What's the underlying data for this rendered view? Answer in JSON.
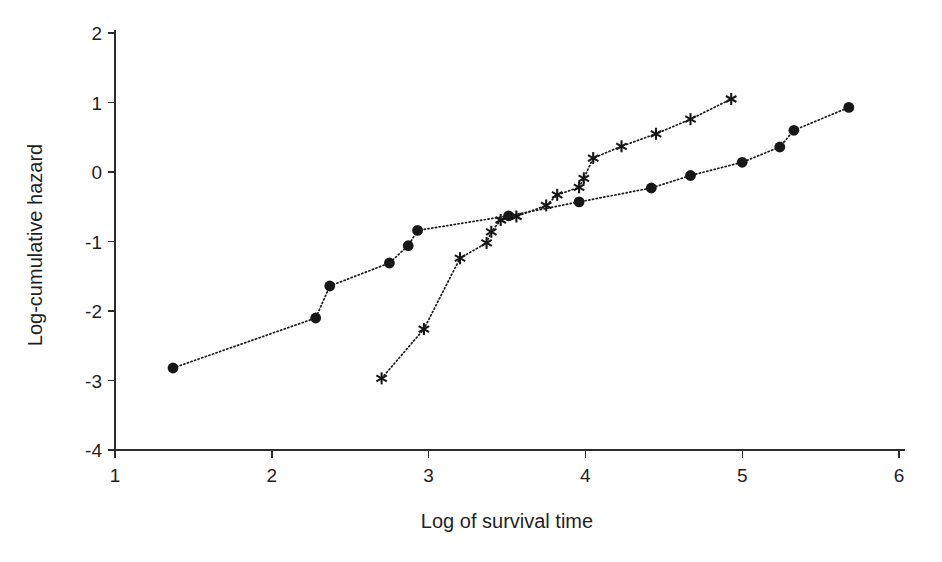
{
  "chart_data": {
    "type": "scatter",
    "title": "",
    "xlabel": "Log of survival time",
    "ylabel": "Log-cumulative hazard",
    "xlim": [
      1,
      6
    ],
    "ylim": [
      -4,
      2
    ],
    "xticks": [
      1,
      2,
      3,
      4,
      5,
      6
    ],
    "yticks": [
      2,
      1,
      0,
      -1,
      -2,
      -3,
      -4
    ],
    "xtick_labels": [
      "1",
      "2",
      "3",
      "4",
      "5",
      "6"
    ],
    "ytick_labels": [
      "2",
      "1",
      "0",
      "-1",
      "-2",
      "-3",
      "-4"
    ],
    "grid": false,
    "legend": "none",
    "series": [
      {
        "name": "group-1",
        "marker": "circle",
        "linestyle": "dotted",
        "points": [
          [
            1.37,
            -2.82
          ],
          [
            2.28,
            -2.1
          ],
          [
            2.37,
            -1.64
          ],
          [
            2.75,
            -1.31
          ],
          [
            2.87,
            -1.06
          ],
          [
            2.93,
            -0.84
          ],
          [
            3.51,
            -0.63
          ],
          [
            3.96,
            -0.43
          ],
          [
            4.42,
            -0.23
          ],
          [
            4.67,
            -0.05
          ],
          [
            5.0,
            0.14
          ],
          [
            5.24,
            0.36
          ],
          [
            5.33,
            0.6
          ],
          [
            5.68,
            0.93
          ]
        ]
      },
      {
        "name": "group-2",
        "marker": "asterisk",
        "linestyle": "dotted",
        "points": [
          [
            2.7,
            -2.97
          ],
          [
            2.97,
            -2.26
          ],
          [
            3.2,
            -1.24
          ],
          [
            3.37,
            -1.02
          ],
          [
            3.4,
            -0.86
          ],
          [
            3.46,
            -0.69
          ],
          [
            3.56,
            -0.64
          ],
          [
            3.75,
            -0.48
          ],
          [
            3.82,
            -0.33
          ],
          [
            3.96,
            -0.22
          ],
          [
            3.99,
            -0.09
          ],
          [
            4.05,
            0.2
          ],
          [
            4.23,
            0.37
          ],
          [
            4.45,
            0.55
          ],
          [
            4.67,
            0.76
          ],
          [
            4.93,
            1.05
          ]
        ]
      }
    ]
  }
}
